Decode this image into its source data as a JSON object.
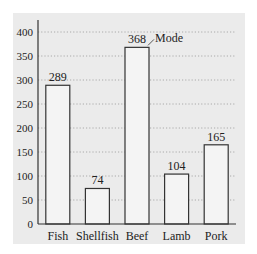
{
  "chart_data": {
    "type": "bar",
    "title": "",
    "xlabel": "",
    "ylabel": "",
    "categories": [
      "Fish",
      "Shellfish",
      "Beef",
      "Lamb",
      "Pork"
    ],
    "values": [
      289,
      74,
      368,
      104,
      165
    ],
    "data_labels": [
      "289",
      "74",
      "368",
      "104",
      "165"
    ],
    "ylim": [
      0,
      400
    ],
    "yticks": [
      0,
      50,
      100,
      150,
      200,
      250,
      300,
      350,
      400
    ],
    "ytick_labels": [
      "0",
      "50",
      "100",
      "150",
      "200",
      "250",
      "300",
      "350",
      "400"
    ],
    "grid": "horizontal dotted",
    "legend": null,
    "annotations": [
      {
        "text": "Mode",
        "target": "Beef"
      }
    ]
  },
  "colors": {
    "panel_bg": "#ebebeb",
    "bar_fill": "#f4f4f4",
    "bar_stroke": "#333333",
    "grid": "#9a9a9a"
  }
}
